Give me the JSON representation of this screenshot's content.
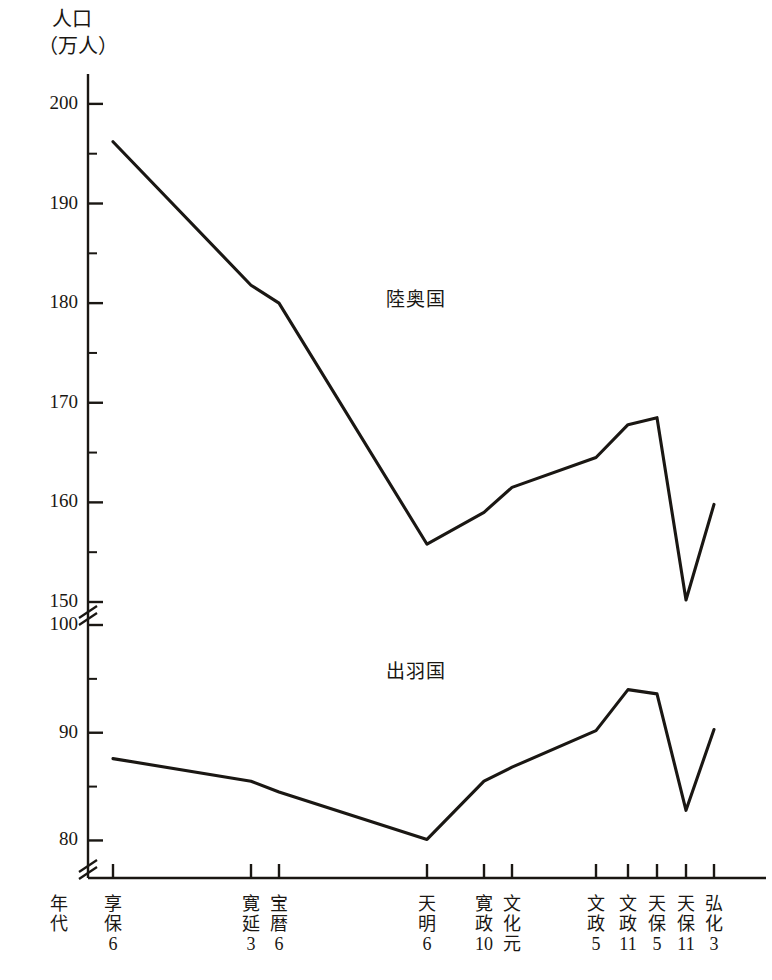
{
  "figure": {
    "y_axis_unit_line1": "人口",
    "y_axis_unit_line2": "（万人）",
    "x_axis_caption_line1": "年",
    "x_axis_caption_line2": "代"
  },
  "chart_data": {
    "type": "line",
    "title": "",
    "xlabel": "年代",
    "ylabel": "人口（万人）",
    "grid": false,
    "legend_position": "inline-annotation",
    "axis_break": true,
    "axis_break_note": "y-axis broken between 150 and 100, and below 80",
    "y_upper_range": [
      150,
      203
    ],
    "y_lower_range": [
      78,
      100
    ],
    "y_major_ticks_upper": [
      150,
      160,
      170,
      180,
      190,
      200
    ],
    "y_major_ticks_lower": [
      80,
      90,
      100
    ],
    "y_minor_tick_step": 5,
    "categories": [
      "享保6",
      "寛延3",
      "宝暦6",
      "天明6",
      "寛政10",
      "文化元",
      "文政5",
      "文政11",
      "天保5",
      "天保11",
      "弘化3"
    ],
    "category_parts": [
      {
        "era": "享保",
        "era_c1": "享",
        "era_c2": "保",
        "year": "6"
      },
      {
        "era": "寛延",
        "era_c1": "寛",
        "era_c2": "延",
        "year": "3"
      },
      {
        "era": "宝暦",
        "era_c1": "宝",
        "era_c2": "暦",
        "year": "6"
      },
      {
        "era": "天明",
        "era_c1": "天",
        "era_c2": "明",
        "year": "6"
      },
      {
        "era": "寛政",
        "era_c1": "寛",
        "era_c2": "政",
        "year": "10"
      },
      {
        "era": "文化",
        "era_c1": "文",
        "era_c2": "化",
        "year": "元"
      },
      {
        "era": "文政",
        "era_c1": "文",
        "era_c2": "政",
        "year": "5"
      },
      {
        "era": "文政",
        "era_c1": "文",
        "era_c2": "政",
        "year": "11"
      },
      {
        "era": "天保",
        "era_c1": "天",
        "era_c2": "保",
        "year": "5"
      },
      {
        "era": "天保",
        "era_c1": "天",
        "era_c2": "保",
        "year": "11"
      },
      {
        "era": "弘化",
        "era_c1": "弘",
        "era_c2": "化",
        "year": "3"
      }
    ],
    "series": [
      {
        "name": "陸奥国",
        "label": "陸奥国",
        "color": "#1a1713",
        "values": [
          196.2,
          181.8,
          180.0,
          155.8,
          159.0,
          161.5,
          164.5,
          167.8,
          168.5,
          150.2,
          159.8
        ]
      },
      {
        "name": "出羽国",
        "label": "出羽国",
        "color": "#1a1713",
        "values": [
          87.6,
          85.5,
          84.5,
          80.1,
          85.5,
          86.8,
          90.2,
          94.0,
          93.6,
          82.8,
          90.3
        ]
      }
    ]
  }
}
